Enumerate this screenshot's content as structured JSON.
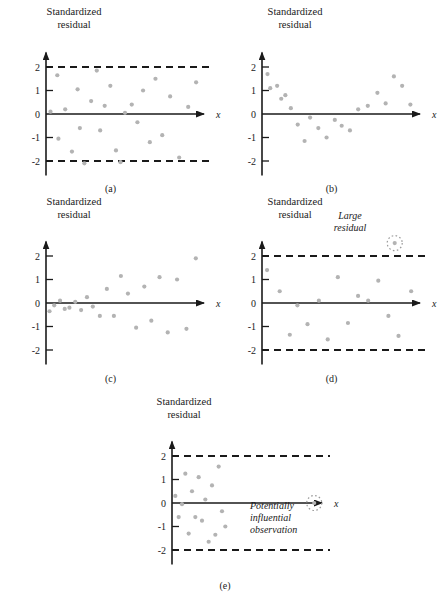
{
  "figure": {
    "axis_label": "Standardized\nresidual",
    "x_axis_label": "x",
    "point_color": "#b3b3b3",
    "axis_color": "#1a1a1a",
    "dashed_color": "#1a1a1a",
    "circle_color": "#999999"
  },
  "panels": [
    {
      "id": "a",
      "caption": "(a)",
      "has_dashed_limits": true,
      "annotation": null,
      "chart_data": {
        "type": "scatter",
        "title": "",
        "xlabel": "x",
        "ylabel": "Standardized residual",
        "ylim": [
          -2.6,
          2.6
        ],
        "yticks": [
          2,
          1,
          0,
          -1,
          -2
        ],
        "ytick_labels": [
          "2",
          "1",
          "0",
          "-1",
          "-2"
        ],
        "grid": false,
        "reference_lines": [
          2,
          -2
        ],
        "x": [
          4,
          10,
          11,
          17,
          23,
          28,
          30,
          34,
          40,
          45,
          48,
          52,
          57,
          62,
          66,
          70,
          76,
          81,
          86,
          92,
          97,
          103,
          110,
          118,
          126,
          133
        ],
        "y": [
          0.1,
          1.65,
          -1.05,
          0.2,
          -1.6,
          1.05,
          -0.6,
          -2.1,
          0.55,
          1.85,
          -0.7,
          0.35,
          1.2,
          -1.55,
          -2.05,
          0.05,
          0.4,
          -0.35,
          1.0,
          -1.2,
          1.5,
          -0.9,
          0.75,
          -1.85,
          0.3,
          1.35
        ]
      }
    },
    {
      "id": "b",
      "caption": "(b)",
      "has_dashed_limits": false,
      "annotation": null,
      "chart_data": {
        "type": "scatter",
        "title": "",
        "xlabel": "x",
        "ylabel": "Standardized residual",
        "ylim": [
          -2.6,
          2.6
        ],
        "yticks": [
          2,
          1,
          0,
          -1,
          -2
        ],
        "ytick_labels": [
          "2",
          "1",
          "0",
          "-1",
          "-2"
        ],
        "grid": false,
        "reference_lines": [],
        "pattern": "curvilinear-U",
        "x": [
          4,
          6,
          11,
          14,
          17,
          21,
          26,
          31,
          35,
          41,
          47,
          53,
          58,
          64,
          70,
          77,
          84,
          90,
          96,
          102,
          108
        ],
        "y": [
          1.7,
          1.1,
          1.2,
          0.65,
          0.8,
          0.25,
          -0.45,
          -1.15,
          -0.15,
          -0.6,
          -1.0,
          -0.25,
          -0.5,
          -0.7,
          0.2,
          0.35,
          0.9,
          0.45,
          1.6,
          1.2,
          0.4
        ]
      }
    },
    {
      "id": "c",
      "caption": "(c)",
      "has_dashed_limits": false,
      "annotation": null,
      "chart_data": {
        "type": "scatter",
        "title": "",
        "xlabel": "x",
        "ylabel": "Standardized residual",
        "ylim": [
          -2.6,
          2.6
        ],
        "yticks": [
          2,
          1,
          0,
          -1,
          -2
        ],
        "ytick_labels": [
          "2",
          "1",
          "0",
          "-1",
          "-2"
        ],
        "grid": false,
        "reference_lines": [],
        "pattern": "megaphone-increasing-variance",
        "x": [
          3,
          7,
          12,
          16,
          20,
          25,
          30,
          35,
          40,
          46,
          52,
          58,
          64,
          70,
          77,
          84,
          90,
          97,
          104,
          112,
          120,
          128
        ],
        "y": [
          -0.35,
          -0.1,
          0.1,
          -0.25,
          -0.2,
          0.05,
          -0.3,
          0.25,
          -0.15,
          -0.55,
          0.6,
          -0.55,
          1.15,
          0.4,
          -1.05,
          0.7,
          -0.75,
          1.1,
          -1.25,
          1.0,
          -1.1,
          1.9
        ]
      }
    },
    {
      "id": "d",
      "caption": "(d)",
      "has_dashed_limits": true,
      "annotation": "Large\nresidual",
      "chart_data": {
        "type": "scatter",
        "title": "",
        "xlabel": "x",
        "ylabel": "Standardized residual",
        "ylim": [
          -2.6,
          2.6
        ],
        "yticks": [
          2,
          1,
          0,
          -1,
          -2
        ],
        "ytick_labels": [
          "2",
          "1",
          "0",
          "-1",
          "-2"
        ],
        "grid": false,
        "reference_lines": [
          2,
          -2
        ],
        "x": [
          4,
          14,
          22,
          28,
          36,
          45,
          52,
          60,
          68,
          76,
          84,
          92,
          100,
          108,
          118
        ],
        "y": [
          1.4,
          0.5,
          -1.35,
          -0.1,
          -0.9,
          0.1,
          -1.55,
          1.1,
          -0.85,
          0.3,
          0.1,
          0.95,
          -0.55,
          -1.4,
          0.5
        ],
        "highlighted_point": {
          "x": 105,
          "y": 2.55,
          "label": "Large residual",
          "circled": true
        }
      }
    },
    {
      "id": "e",
      "caption": "(e)",
      "has_dashed_limits": true,
      "annotation": "Potentially\ninfluential\nobservation",
      "chart_data": {
        "type": "scatter",
        "title": "",
        "xlabel": "x",
        "ylabel": "Standardized residual",
        "ylim": [
          -2.6,
          2.6
        ],
        "yticks": [
          2,
          1,
          0,
          -1,
          -2
        ],
        "ytick_labels": [
          "2",
          "1",
          "0",
          "-1",
          "-2"
        ],
        "grid": false,
        "reference_lines": [
          2,
          -2
        ],
        "pattern": "clustered-left-with-isolated-point",
        "x": [
          3,
          6,
          9,
          12,
          15,
          18,
          21,
          24,
          27,
          30,
          33,
          36,
          39,
          42,
          45,
          48
        ],
        "y": [
          0.3,
          -0.6,
          -0.05,
          1.25,
          -1.3,
          0.5,
          -0.6,
          1.1,
          -0.75,
          0.15,
          -1.65,
          0.75,
          -1.35,
          1.55,
          -0.35,
          -1.0
        ],
        "highlighted_point": {
          "x": 128,
          "y": 0,
          "label": "Potentially influential observation",
          "circled": true
        }
      }
    }
  ]
}
